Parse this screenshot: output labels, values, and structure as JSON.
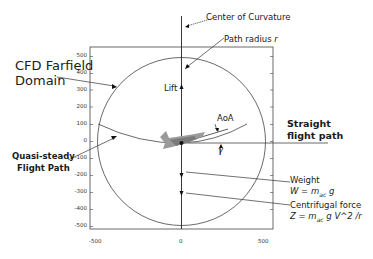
{
  "diagram": {
    "labels": {
      "center_of_curvature": "Center of Curvature",
      "path_radius": "Path radius ",
      "path_radius_symbol": "r",
      "cfd_farfield_line1": "CFD Farfield",
      "cfd_farfield_line2": "Domain",
      "lift": "Lift",
      "aoa": "AoA",
      "straight_line1": "Straight",
      "straight_line2": "flight path",
      "gamma_symbol": "γ",
      "quasi_line1": "Quasi-steady",
      "quasi_line2": "Flight Path",
      "weight": "Weight",
      "weight_eq": "W = m",
      "weight_eq_sub": "ac",
      "weight_eq_tail": " g",
      "centrifugal": "Centrifugal force",
      "centrifugal_eq": "Z = m",
      "centrifugal_eq_sub": "ac",
      "centrifugal_eq_tail": " g V^2 /r"
    },
    "axes": {
      "y_ticks": [
        "500",
        "400",
        "300",
        "200",
        "100",
        "0",
        "-100",
        "-200",
        "-300",
        "-400",
        "-500"
      ],
      "x_ticks": [
        "-500",
        "0",
        "500"
      ],
      "xlim": [
        -550,
        550
      ],
      "ylim": [
        -550,
        550
      ]
    },
    "colors": {
      "line": "#333333",
      "aircraft": "#9a9a9a",
      "aircraft_dark": "#6e6e6e"
    }
  }
}
